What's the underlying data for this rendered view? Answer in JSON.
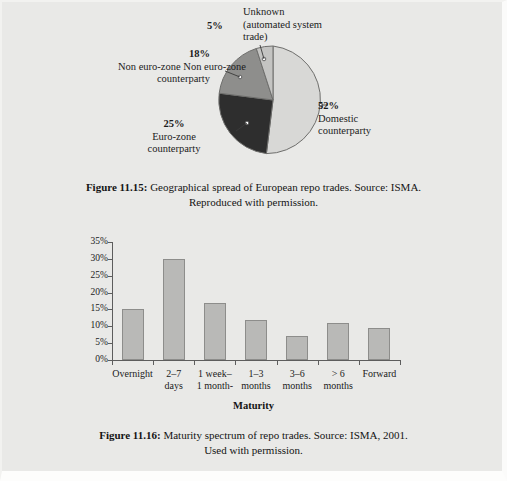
{
  "page": {
    "background": "#e9e9e7"
  },
  "figure_pie": {
    "caption_prefix": "Figure 11.15:",
    "caption_text": " Geographical spread of European repo trades. Source: ISMA.",
    "caption_line2": "Reproduced with permission."
  },
  "figure_bar": {
    "caption_prefix": "Figure 11.16:",
    "caption_text": " Maturity spectrum of repo trades. Source: ISMA, 2001.",
    "caption_line2": "Used with permission."
  },
  "labels": {
    "unknown_pct": "5%",
    "unknown_l1": "Unknown",
    "unknown_l2": "(automated system",
    "unknown_l3": "trade)",
    "domestic_pct": "52%",
    "domestic_l1": "Domestic",
    "domestic_l2": "counterparty",
    "noneuro_pct": "18%",
    "noneuro_l1": "Non euro-zone",
    "noneuro_l2": "counterparty",
    "euro_pct": "25%",
    "euro_l1": "Euro-zone",
    "euro_l2": "counterparty"
  },
  "chart_data": [
    {
      "type": "pie",
      "title": "Geographical spread of European repo trades",
      "labels": [
        "Domestic counterparty",
        "Euro-zone counterparty",
        "Non euro-zone counterparty",
        "Unknown (automated system trade)"
      ],
      "values": [
        52,
        25,
        18,
        5
      ],
      "value_labels": [
        "52%",
        "25%",
        "18%",
        "5%"
      ],
      "colors": [
        "#d8d8d6",
        "#2e2e2e",
        "#8e8e8c",
        "#c4c4c2"
      ],
      "legend": "none",
      "source": "ISMA"
    },
    {
      "type": "bar",
      "title": "Maturity spectrum of repo trades",
      "categories": [
        "Overnight",
        "2–7 days",
        "1 week– 1 month-",
        "1–3 months",
        "3–6 months",
        "> 6 months",
        "Forward"
      ],
      "category_lines": [
        [
          "Overnight",
          ""
        ],
        [
          "2–7",
          "days"
        ],
        [
          "1 week–",
          "1 month-"
        ],
        [
          "1–3",
          "months"
        ],
        [
          "3–6",
          "months"
        ],
        [
          "> 6",
          "months"
        ],
        [
          "Forward",
          ""
        ]
      ],
      "values": [
        15,
        30,
        17,
        12,
        7,
        11,
        9.5
      ],
      "xlabel": "Maturity",
      "ylabel": "",
      "ylim": [
        0,
        35
      ],
      "yticks": [
        0,
        5,
        10,
        15,
        20,
        25,
        30,
        35
      ],
      "ytick_labels": [
        "0%",
        "5%",
        "10%",
        "15%",
        "20%",
        "25%",
        "30%",
        "35%"
      ],
      "grid": false,
      "bar_color": "#b9b9b7",
      "bar_edge_color": "#8d8d8b",
      "source": "ISMA, 2001"
    }
  ]
}
